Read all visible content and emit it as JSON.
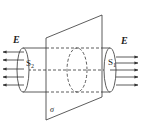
{
  "diagram": {
    "labels": {
      "field_left": "E",
      "field_right": "E",
      "surface_left": "S",
      "surface_left_sub": "2",
      "surface_right": "S",
      "surface_right_sub": "1",
      "plane": "σ"
    },
    "colors": {
      "line": "#333333",
      "background": "#ffffff"
    }
  }
}
